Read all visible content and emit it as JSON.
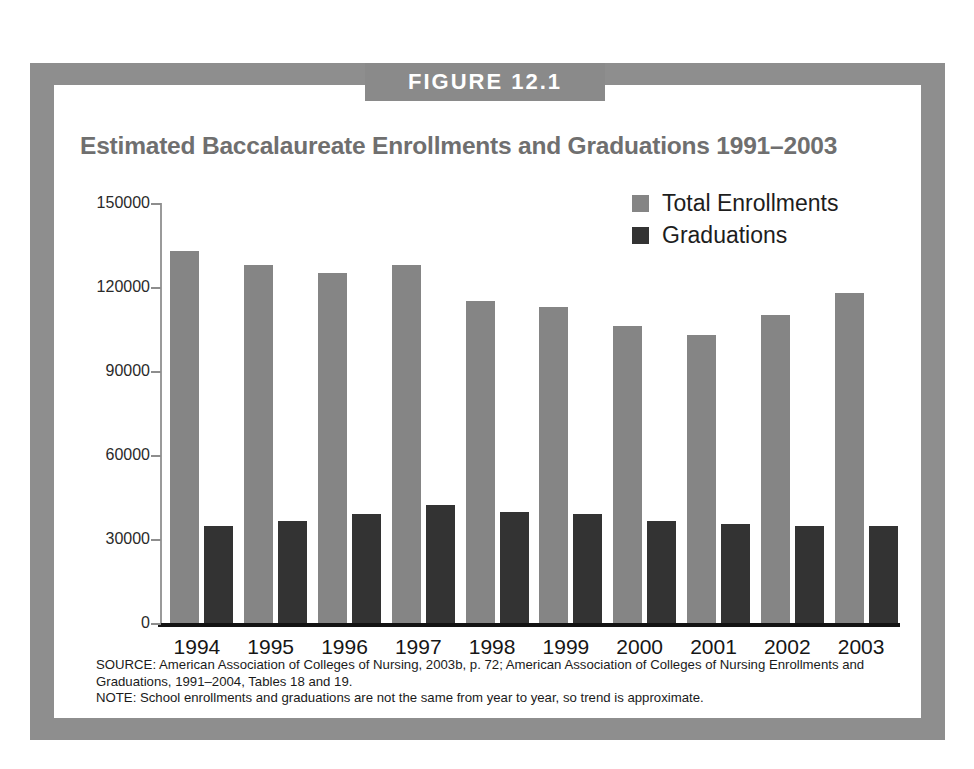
{
  "figure": {
    "banner_label": "FIGURE 12.1",
    "title": "Estimated Baccalaureate Enrollments and Graduations 1991–2003",
    "source_note": "SOURCE: American Association of Colleges of Nursing, 2003b, p. 72; American Association of Colleges of Nursing Enrollments and Graduations, 1991–2004, Tables 18 and 19.",
    "general_note": "NOTE: School enrollments and graduations are not the same from year to year, so trend is approximate."
  },
  "colors": {
    "frame": "#8e8e8e",
    "banner": "#8a8a8a",
    "title_text": "#6f6f6f",
    "enrollments_bar": "#858585",
    "graduations_bar": "#333333",
    "axis": "#131313",
    "panel_background": "#ffffff"
  },
  "chart_data": {
    "type": "bar",
    "title": "Estimated Baccalaureate Enrollments and Graduations 1991–2003",
    "xlabel": "",
    "ylabel": "",
    "categories": [
      "1994",
      "1995",
      "1996",
      "1997",
      "1998",
      "1999",
      "2000",
      "2001",
      "2002",
      "2003"
    ],
    "series": [
      {
        "name": "Total Enrollments",
        "color": "#858585",
        "values": [
          133000,
          128000,
          125000,
          128000,
          115000,
          113000,
          106000,
          103000,
          110000,
          118000
        ]
      },
      {
        "name": "Graduations",
        "color": "#333333",
        "values": [
          34500,
          36500,
          39000,
          42000,
          39500,
          39000,
          36500,
          35500,
          34500,
          34500
        ]
      }
    ],
    "ylim": [
      0,
      150000
    ],
    "ytick_values": [
      0,
      30000,
      60000,
      90000,
      120000,
      150000
    ],
    "ytick_labels": [
      "0",
      "30000",
      "60000",
      "90000",
      "120000",
      "150000"
    ],
    "grid": false,
    "legend_position": "top-right"
  }
}
